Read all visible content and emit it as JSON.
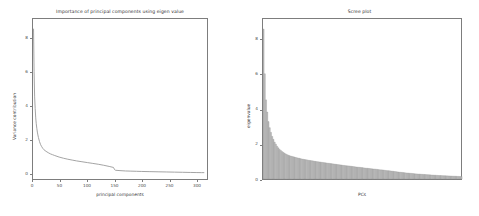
{
  "figure": {
    "background": "#ffffff",
    "axis_color": "#7d7d7d",
    "line_color": "#9a9a9a",
    "bar_fill": "#bfbfbf",
    "bar_edge": "#8f8f8f",
    "text_color": "#3a3a3a"
  },
  "chart_data": [
    {
      "type": "line",
      "title": "Importance of principal components using eigen value",
      "xlabel": "principal components",
      "ylabel": "Variance contribution",
      "xlim": [
        0,
        320
      ],
      "ylim": [
        -0.35,
        9.2
      ],
      "xticks": [
        0,
        50,
        100,
        150,
        200,
        250,
        300
      ],
      "xticklabels": [
        "0",
        "50",
        "100",
        "150",
        "200",
        "250",
        "300"
      ],
      "yticks": [
        0,
        2,
        4,
        6,
        8
      ],
      "yticklabels": [
        "0",
        "2",
        "4",
        "6",
        "8"
      ],
      "grid": false,
      "legend": "none",
      "x": [
        1,
        2,
        3,
        4,
        5,
        6,
        7,
        8,
        9,
        10,
        12,
        14,
        16,
        18,
        20,
        24,
        28,
        32,
        36,
        40,
        48,
        56,
        64,
        72,
        80,
        90,
        100,
        110,
        120,
        130,
        140,
        148,
        150,
        152,
        160,
        170,
        180,
        190,
        200,
        215,
        230,
        245,
        260,
        275,
        290,
        300,
        310,
        315
      ],
      "y": [
        8.62,
        6.05,
        4.55,
        3.85,
        3.3,
        2.95,
        2.68,
        2.45,
        2.28,
        2.12,
        1.88,
        1.7,
        1.58,
        1.48,
        1.4,
        1.3,
        1.22,
        1.15,
        1.1,
        1.05,
        0.96,
        0.89,
        0.83,
        0.78,
        0.73,
        0.68,
        0.63,
        0.58,
        0.53,
        0.47,
        0.4,
        0.34,
        0.21,
        0.17,
        0.15,
        0.13,
        0.12,
        0.11,
        0.1,
        0.09,
        0.08,
        0.07,
        0.06,
        0.05,
        0.04,
        0.035,
        0.03,
        0.03
      ]
    },
    {
      "type": "bar",
      "title": "Scree plot",
      "xlabel": "PCs",
      "ylabel": "eigenvalue",
      "xlim": [
        0,
        320
      ],
      "ylim": [
        0,
        9.2
      ],
      "yticks": [
        0,
        2,
        4,
        6,
        8
      ],
      "yticklabels": [
        "0",
        "2",
        "4",
        "6",
        "8"
      ],
      "grid": false,
      "legend": "none",
      "bar_count": 160,
      "values": [
        8.62,
        6.05,
        4.55,
        3.85,
        3.3,
        2.95,
        2.68,
        2.45,
        2.28,
        2.12,
        2.0,
        1.88,
        1.79,
        1.7,
        1.64,
        1.58,
        1.53,
        1.48,
        1.44,
        1.4,
        1.37,
        1.34,
        1.32,
        1.3,
        1.28,
        1.26,
        1.24,
        1.22,
        1.2,
        1.19,
        1.17,
        1.15,
        1.14,
        1.12,
        1.11,
        1.1,
        1.08,
        1.07,
        1.06,
        1.05,
        1.04,
        1.02,
        1.01,
        1.0,
        0.99,
        0.98,
        0.97,
        0.96,
        0.95,
        0.94,
        0.93,
        0.92,
        0.91,
        0.9,
        0.89,
        0.88,
        0.87,
        0.86,
        0.85,
        0.84,
        0.83,
        0.82,
        0.81,
        0.8,
        0.79,
        0.78,
        0.77,
        0.76,
        0.755,
        0.75,
        0.74,
        0.73,
        0.72,
        0.71,
        0.7,
        0.69,
        0.68,
        0.675,
        0.67,
        0.66,
        0.65,
        0.64,
        0.63,
        0.62,
        0.615,
        0.61,
        0.6,
        0.59,
        0.58,
        0.575,
        0.57,
        0.56,
        0.55,
        0.54,
        0.53,
        0.525,
        0.52,
        0.51,
        0.5,
        0.49,
        0.48,
        0.475,
        0.47,
        0.46,
        0.45,
        0.44,
        0.43,
        0.42,
        0.41,
        0.4,
        0.39,
        0.385,
        0.38,
        0.37,
        0.36,
        0.35,
        0.345,
        0.34,
        0.33,
        0.325,
        0.32,
        0.31,
        0.3,
        0.295,
        0.29,
        0.285,
        0.28,
        0.275,
        0.27,
        0.265,
        0.26,
        0.255,
        0.25,
        0.245,
        0.24,
        0.235,
        0.23,
        0.225,
        0.22,
        0.215,
        0.21,
        0.205,
        0.2,
        0.198,
        0.195,
        0.19,
        0.188,
        0.185,
        0.18,
        0.178,
        0.175,
        0.17,
        0.168,
        0.165,
        0.16,
        0.158,
        0.155,
        0.15,
        0.148,
        0.145,
        0.14
      ]
    }
  ]
}
